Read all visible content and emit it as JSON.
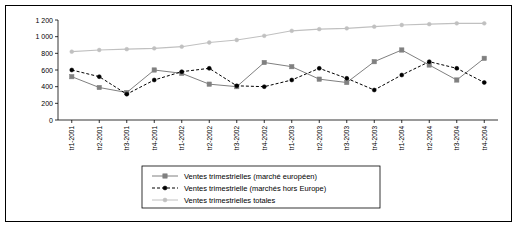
{
  "chart_data": {
    "type": "line",
    "title": "",
    "xlabel": "",
    "ylabel": "",
    "ylim": [
      0,
      1200
    ],
    "yticks": [
      0,
      200,
      400,
      600,
      800,
      1000,
      1200
    ],
    "ytick_labels": [
      "0",
      "200",
      "400",
      "600",
      "800",
      "1 000",
      "1 200"
    ],
    "grid": false,
    "legend_position": "bottom",
    "categories": [
      "tr1-2001",
      "tr2-2001",
      "tr3-2001",
      "tr4-2001",
      "tr1-2002",
      "tr2-2002",
      "tr3-2002",
      "tr4-2002",
      "tr1-2003",
      "tr2-2003",
      "tr3-2003",
      "tr4-2003",
      "tr1-2004",
      "tr2-2004",
      "tr3-2004",
      "tr4-2004"
    ],
    "series": [
      {
        "name": "Ventes trimestrielles (marché européen)",
        "color": "#808080",
        "marker": "square",
        "line": "solid",
        "values": [
          520,
          390,
          330,
          600,
          560,
          430,
          400,
          690,
          640,
          490,
          450,
          700,
          840,
          660,
          480,
          740
        ]
      },
      {
        "name": "Ventes trimestrielle (marchés hors Europe)",
        "color": "#000000",
        "marker": "circle",
        "line": "dashed",
        "values": [
          600,
          520,
          310,
          480,
          580,
          620,
          410,
          400,
          480,
          620,
          500,
          360,
          540,
          700,
          620,
          450
        ]
      },
      {
        "name": "Ventes trimestrielles totales",
        "color": "#c0c0c0",
        "marker": "circle",
        "line": "solid",
        "values": [
          820,
          840,
          850,
          860,
          880,
          930,
          960,
          1010,
          1070,
          1090,
          1100,
          1120,
          1140,
          1150,
          1160,
          1160
        ]
      }
    ]
  }
}
